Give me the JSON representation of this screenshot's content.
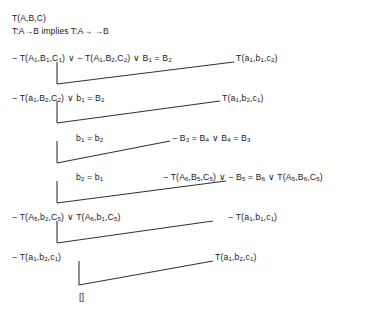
{
  "diagram": {
    "type": "resolution-refutation-proof-tree",
    "title_lines": [
      {
        "id": "predicate-decl",
        "text": "T(A,B,C)"
      },
      {
        "id": "functionality-axiom",
        "text": "T:A→B implies T:A→ →B"
      }
    ],
    "symbols": {
      "negation": "−",
      "disjunction": "∨",
      "arrow": "→",
      "empty_clause": "[]"
    },
    "line_color": "#333333",
    "text_color": "#1a1a1a",
    "background": "#ffffff",
    "left_clauses": [
      {
        "id": "clause-left-1",
        "x": 12,
        "y": 53,
        "html": "− T(A<sub>1</sub>,B<sub>1</sub>,C<sub>1</sub>) ∨ − T(A<sub>1</sub>,B<sub>2</sub>,C<sub>2</sub>) ∨ B<sub>1</sub> = B<sub>2</sub>",
        "plain": "− T(A1,B1,C1) ∨ − T(A1,B2,C2) ∨ B1 = B2"
      },
      {
        "id": "clause-left-2",
        "x": 12,
        "y": 93,
        "html": "− T(a<sub>1</sub>,B<sub>2</sub>,C<sub>2</sub>) ∨ b<sub>1</sub> = B<sub>2</sub>",
        "plain": "− T(a1,B2,C2) ∨ b1 = B2"
      },
      {
        "id": "clause-left-3",
        "x": 76,
        "y": 133,
        "html": "b<sub>1</sub> = b<sub>2</sub>",
        "plain": "b1 = b2"
      },
      {
        "id": "clause-left-4",
        "x": 76,
        "y": 172,
        "html": "b<sub>2</sub> = b<sub>1</sub>",
        "plain": "b2 = b1"
      },
      {
        "id": "clause-left-5",
        "x": 12,
        "y": 212,
        "html": "− T(A<sub>5</sub>,b<sub>2</sub>,C<sub>5</sub>) ∨ T(A<sub>6</sub>,b<sub>1</sub>,C<sub>5</sub>)",
        "plain": "− T(A5,b2,C5) ∨ T(A6,b1,C5)"
      },
      {
        "id": "clause-left-6",
        "x": 12,
        "y": 252,
        "html": "− T(a<sub>1</sub>,b<sub>2</sub>,c<sub>1</sub>)",
        "plain": "− T(a1,b2,c1)"
      },
      {
        "id": "clause-empty",
        "x": 79,
        "y": 292,
        "html": "[]",
        "plain": "[]"
      }
    ],
    "right_clauses": [
      {
        "id": "clause-right-1",
        "x": 236,
        "y": 53,
        "html": "T(a<sub>1</sub>,b<sub>1</sub>,c<sub>2</sub>)",
        "plain": "T(a1,b1,c2)"
      },
      {
        "id": "clause-right-2",
        "x": 222,
        "y": 93,
        "html": "T(a<sub>1</sub>,b<sub>2</sub>,c<sub>1</sub>)",
        "plain": "T(a1,b2,c1)"
      },
      {
        "id": "clause-right-3",
        "x": 172,
        "y": 133,
        "html": "− B<sub>3</sub> = B<sub>4</sub> ∨ B<sub>4</sub> = B<sub>3</sub>",
        "plain": "− B3 = B4 ∨ B4 = B3"
      },
      {
        "id": "clause-right-4",
        "x": 163,
        "y": 172,
        "html": "− T(A<sub>6</sub>,B<sub>5</sub>,C<sub>5</sub>) ∨ − B<sub>5</sub> = B<sub>6</sub> ∨ T(A<sub>5</sub>,B<sub>6</sub>,C<sub>5</sub>)",
        "plain": "− T(A6,B5,C5) ∨ − B5 = B6 ∨ T(A5,B6,C5)"
      },
      {
        "id": "clause-right-5",
        "x": 228,
        "y": 212,
        "html": "− T(a<sub>1</sub>,b<sub>1</sub>,c<sub>1</sub>)",
        "plain": "− T(a1,b1,c1)"
      },
      {
        "id": "clause-right-6",
        "x": 215,
        "y": 252,
        "html": "T(a<sub>1</sub>,b<sub>2</sub>,c<sub>1</sub>)",
        "plain": "T(a1,b2,c1)"
      }
    ],
    "edges": [
      {
        "id": "edge-1",
        "vx": 57,
        "vy1": 62,
        "vy2": 84,
        "dx2": 234,
        "dy2": 62
      },
      {
        "id": "edge-2",
        "vx": 57,
        "vy1": 101,
        "vy2": 123,
        "dx2": 220,
        "dy2": 101
      },
      {
        "id": "edge-3",
        "vx": 57,
        "vy1": 141,
        "vy2": 163,
        "dx2": 170,
        "dy2": 141
      },
      {
        "id": "edge-4",
        "vx": 57,
        "vy1": 181,
        "vy2": 203,
        "dx2": 226,
        "dy2": 181
      },
      {
        "id": "edge-5",
        "vx": 57,
        "vy1": 221,
        "vy2": 243,
        "dx2": 213,
        "dy2": 221
      },
      {
        "id": "edge-6",
        "vx": 79,
        "vy1": 261,
        "vy2": 285,
        "dx2": 213,
        "dy2": 261
      }
    ]
  }
}
